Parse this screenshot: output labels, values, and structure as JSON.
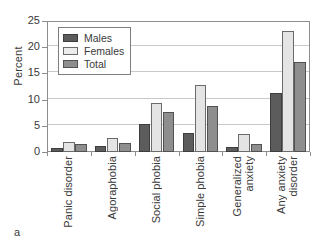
{
  "panel_label": "a",
  "chart_data": {
    "type": "bar",
    "title": "",
    "xlabel": "",
    "ylabel": "Percent",
    "ylim": [
      0,
      25
    ],
    "yticks": [
      0,
      5,
      10,
      15,
      20,
      25
    ],
    "grid": true,
    "legend_position": "top-left-inside",
    "categories": [
      "Panic disorder",
      "Agoraphobia",
      "Social phobia",
      "Simple phobia",
      "Generalized anxiety",
      "Any anxiety disorder"
    ],
    "category_label_lines": [
      [
        "Panic disorder"
      ],
      [
        "Agoraphobia"
      ],
      [
        "Social phobia"
      ],
      [
        "Simple phobia"
      ],
      [
        "Generalized",
        "anxiety"
      ],
      [
        "Any anxiety",
        "disorder"
      ]
    ],
    "series": [
      {
        "name": "Males",
        "color": "#5c5c5c",
        "values": [
          0.8,
          1.2,
          5.4,
          3.6,
          1.0,
          11.2
        ]
      },
      {
        "name": "Females",
        "color": "#e4e4e4",
        "values": [
          2.0,
          2.6,
          9.4,
          12.8,
          3.4,
          23.0
        ]
      },
      {
        "name": "Total",
        "color": "#8e8e8e",
        "values": [
          1.5,
          1.8,
          7.6,
          8.8,
          1.6,
          17.2
        ]
      }
    ]
  }
}
